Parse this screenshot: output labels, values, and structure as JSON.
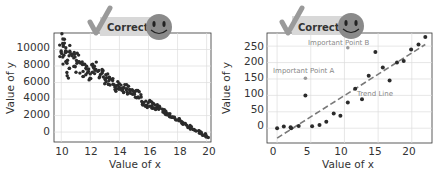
{
  "chart_data": [
    {
      "type": "scatter",
      "title": "",
      "xlabel": "Value of x",
      "ylabel": "Value of y",
      "xlim": [
        9.5,
        20.3
      ],
      "ylim": [
        -1200,
        12000
      ],
      "x_ticks": [
        "10",
        "12",
        "14",
        "16",
        "18",
        "20"
      ],
      "y_ticks": [
        "0",
        "2000",
        "4000",
        "6000",
        "8000",
        "10000"
      ],
      "grid": true,
      "badge": "Correct",
      "series": [
        {
          "name": "points",
          "description": "dense negatively correlated scatter, y roughly 10000 at x=10 decreasing to about -500 at x=20, spread narrows as x increases",
          "x": [
            10.0,
            10.1,
            10.2,
            10.3,
            10.4,
            10.5,
            10.6,
            10.8,
            11.0,
            11.2,
            11.4,
            11.6,
            11.8,
            12.0,
            12.2,
            12.4,
            12.6,
            12.8,
            13.0,
            13.2,
            13.4,
            13.6,
            13.8,
            14.0,
            14.2,
            14.4,
            14.6,
            14.8,
            15.0,
            15.2,
            15.4,
            15.6,
            15.8,
            16.0,
            16.2,
            16.4,
            16.6,
            16.8,
            17.0,
            17.2,
            17.4,
            17.6,
            17.8,
            18.0,
            18.2,
            18.4,
            18.6,
            18.8,
            19.0,
            19.2,
            19.4,
            19.6,
            19.8,
            20.0
          ],
          "y": [
            9700,
            11300,
            9200,
            10200,
            8900,
            7400,
            9800,
            8700,
            8200,
            8600,
            7800,
            7600,
            8000,
            7200,
            7500,
            7800,
            6700,
            6800,
            6500,
            6300,
            6400,
            5900,
            5600,
            5800,
            5400,
            5200,
            5000,
            4900,
            4700,
            4600,
            4400,
            3700,
            3600,
            3400,
            3300,
            3100,
            3000,
            2900,
            2600,
            2300,
            2100,
            1900,
            1700,
            1500,
            1300,
            1100,
            900,
            700,
            500,
            300,
            100,
            -100,
            -300,
            -500
          ]
        }
      ]
    },
    {
      "type": "scatter",
      "title": "",
      "xlabel": "Value of x",
      "ylabel": "Value of y",
      "xlim": [
        -1.5,
        23
      ],
      "ylim": [
        -45,
        290
      ],
      "x_ticks": [
        "0",
        "5",
        "10",
        "15",
        "20"
      ],
      "y_ticks": [
        "0",
        "50",
        "100",
        "150",
        "200",
        "250"
      ],
      "grid": true,
      "badge": "Correct",
      "series": [
        {
          "name": "points",
          "x": [
            0,
            1,
            2,
            2.1,
            3.2,
            4.2,
            5.2,
            6.3,
            7.3,
            8.4,
            9.4,
            10.5,
            11.6,
            12.6,
            13.6,
            14.6,
            15.7,
            16.7,
            17.8,
            18.8,
            19.9,
            21.0,
            22.0
          ],
          "y": [
            0,
            5,
            3,
            0,
            7,
            100,
            6,
            10,
            20,
            45,
            38,
            78,
            120,
            88,
            160,
            232,
            185,
            145,
            200,
            205,
            240,
            255,
            278
          ]
        },
        {
          "name": "Trend Line",
          "type": "line",
          "style": "dashed",
          "x": [
            0,
            22
          ],
          "y": [
            -30,
            255
          ]
        },
        {
          "name": "highlighted",
          "color": "#999999",
          "x": [
            4.2,
            10.5
          ],
          "y": [
            152,
            245
          ]
        }
      ],
      "annotations": [
        {
          "text": "Important Point A",
          "x": 0,
          "y": 170
        },
        {
          "text": "Important Point B",
          "x": 6.5,
          "y": 262
        },
        {
          "text": "Trend Line",
          "x": 12.5,
          "y": 100
        }
      ]
    }
  ],
  "left": {
    "badge": "Correct",
    "xlabel": "Value of x",
    "ylabel": "Value of y",
    "x_ticks": [
      "10",
      "12",
      "14",
      "16",
      "18",
      "20"
    ],
    "y_ticks": [
      "0",
      "2000",
      "4000",
      "6000",
      "8000",
      "10000"
    ]
  },
  "right": {
    "badge": "Correct",
    "xlabel": "Value of x",
    "ylabel": "Value of y",
    "x_ticks": [
      "0",
      "5",
      "10",
      "15",
      "20"
    ],
    "y_ticks": [
      "0",
      "50",
      "100",
      "150",
      "200",
      "250"
    ],
    "ann_a": "Important Point A",
    "ann_b": "Important Point B",
    "ann_trend": "Trend Line"
  },
  "colors": {
    "point": "#2b2b2b",
    "grid": "#dddddd",
    "trend": "#7a7a7a",
    "badge_bg": "#d8d8d8",
    "check": "#9a9a9a",
    "smiley": "#8a8a8a"
  }
}
